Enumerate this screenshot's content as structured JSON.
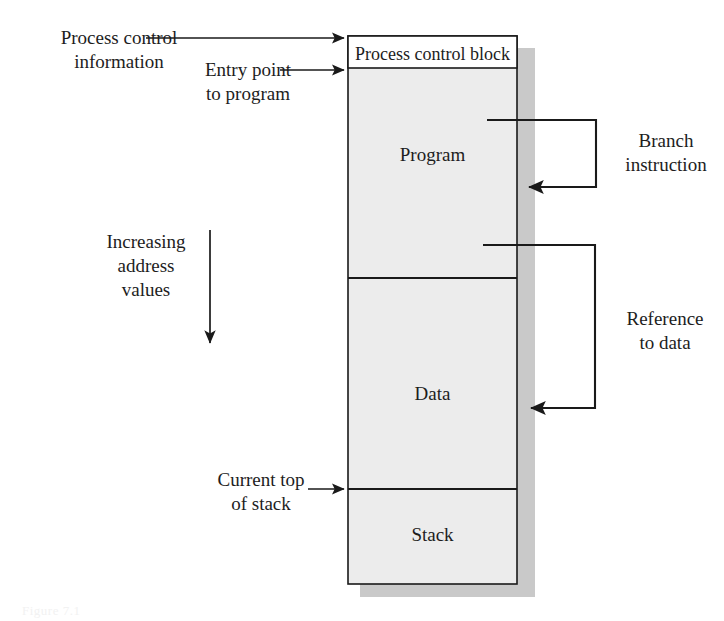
{
  "figure": {
    "caption": "Figure 7.1",
    "colors": {
      "block_fill": "#ececec",
      "block_stroke": "#1a1a1a",
      "shadow": "#c9c9c9",
      "pcb_fill": "#ffffff",
      "text": "#1d1d1d",
      "background": "#ffffff"
    }
  },
  "memory_block": {
    "segments": [
      {
        "name": "process-control-block",
        "label": "Process control block"
      },
      {
        "name": "program",
        "label": "Program"
      },
      {
        "name": "data",
        "label": "Data"
      },
      {
        "name": "stack",
        "label": "Stack"
      }
    ]
  },
  "callouts": {
    "left": [
      {
        "name": "process-control-information",
        "label": "Process control\ninformation"
      },
      {
        "name": "entry-point-to-program",
        "label": "Entry point\nto program"
      },
      {
        "name": "increasing-address-values",
        "label": "Increasing\naddress\nvalues"
      },
      {
        "name": "current-top-of-stack",
        "label": "Current top\nof stack"
      }
    ],
    "right": [
      {
        "name": "branch-instruction",
        "label": "Branch\ninstruction"
      },
      {
        "name": "reference-to-data",
        "label": "Reference\nto data"
      }
    ]
  }
}
